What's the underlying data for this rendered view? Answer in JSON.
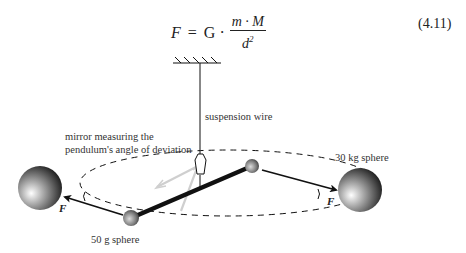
{
  "equation": {
    "lhs": "F",
    "equals": "=",
    "constant": "G",
    "dot": "·",
    "numerator": "m · M",
    "denominator_base": "d",
    "denominator_exp": "2",
    "number": "(4.11)"
  },
  "figure": {
    "labels": {
      "suspension_wire": "suspension wire",
      "mirror_line1": "mirror measuring the",
      "mirror_line2": "pendulum's angle of deviation",
      "large_sphere": "30 kg sphere",
      "small_sphere": "50 g sphere"
    },
    "force_labels": {
      "left": "F",
      "right": "F"
    },
    "colors": {
      "line": "#111111",
      "mirror_ray": "#cfcfcf",
      "sphere_highlight": "#ffffff",
      "sphere_shadow": "#111111"
    }
  }
}
